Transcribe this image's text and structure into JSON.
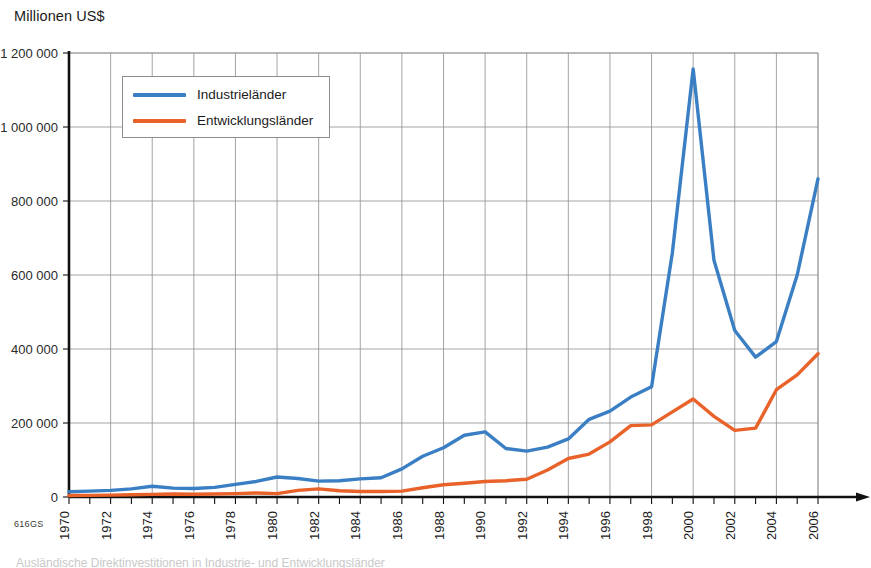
{
  "figure": {
    "axis_title": "Millionen US$",
    "source_code": "616GS",
    "bottom_caption_partial": "Ausländische Direktinvestitionen in Industrie- und Entwicklungsländer"
  },
  "legend": {
    "position": "inside-top-left",
    "items": [
      {
        "label": "Industrieländer",
        "color": "#3a7fc4",
        "swatch_name": "line-swatch-blue"
      },
      {
        "label": "Entwicklungsländer",
        "color": "#e8622a",
        "swatch_name": "line-swatch-orange"
      }
    ]
  },
  "colors": {
    "industrielaender": "#3a7fc4",
    "entwicklungslaender": "#e8622a",
    "grid": "#9a9a9a",
    "axis": "#111111",
    "background": "#ffffff"
  },
  "chart_data": {
    "type": "line",
    "title": "",
    "subtitle": "",
    "xlabel": "",
    "ylabel": "Millionen US$",
    "grid": true,
    "legend_position": "inside-top-left",
    "xlim": [
      1970,
      2006
    ],
    "ylim": [
      0,
      1200000
    ],
    "ytick_labels": [
      "0",
      "200 000",
      "400 000",
      "600 000",
      "800 000",
      "1 000 000",
      "1 200 000"
    ],
    "yticks": [
      0,
      200000,
      400000,
      600000,
      800000,
      1000000,
      1200000
    ],
    "xtick_labels": [
      "1970",
      "1972",
      "1974",
      "1976",
      "1978",
      "1980",
      "1982",
      "1984",
      "1986",
      "1988",
      "1990",
      "1992",
      "1994",
      "1996",
      "1998",
      "2000",
      "2002",
      "2004",
      "2006"
    ],
    "xticks": [
      1970,
      1972,
      1974,
      1976,
      1978,
      1980,
      1982,
      1984,
      1986,
      1988,
      1990,
      1992,
      1994,
      1996,
      1998,
      2000,
      2002,
      2004,
      2006
    ],
    "x": [
      1970,
      1971,
      1972,
      1973,
      1974,
      1975,
      1976,
      1977,
      1978,
      1979,
      1980,
      1981,
      1982,
      1983,
      1984,
      1985,
      1986,
      1987,
      1988,
      1989,
      1990,
      1991,
      1992,
      1993,
      1994,
      1995,
      1996,
      1997,
      1998,
      1999,
      2000,
      2001,
      2002,
      2003,
      2004,
      2005,
      2006
    ],
    "series": [
      {
        "name": "Industrieländer",
        "color": "#3a7fc4",
        "values": [
          14000,
          16000,
          18000,
          22000,
          29000,
          24000,
          23000,
          26000,
          34000,
          42000,
          54000,
          50000,
          43000,
          44000,
          49000,
          52000,
          76000,
          110000,
          133000,
          167000,
          176000,
          131000,
          124000,
          135000,
          157000,
          210000,
          232000,
          270000,
          298000,
          660000,
          1157000,
          640000,
          450000,
          378000,
          420000,
          600000,
          860000
        ]
      },
      {
        "name": "Entwicklungsländer",
        "color": "#e8622a",
        "values": [
          4000,
          4500,
          5000,
          6000,
          7000,
          8000,
          7500,
          8000,
          9000,
          11000,
          9000,
          18000,
          22000,
          17000,
          15000,
          15000,
          16000,
          25000,
          33000,
          37000,
          42000,
          44000,
          48000,
          73000,
          104000,
          116000,
          149000,
          193000,
          195000,
          230000,
          265000,
          218000,
          180000,
          186000,
          290000,
          330000,
          387000
        ]
      }
    ]
  }
}
